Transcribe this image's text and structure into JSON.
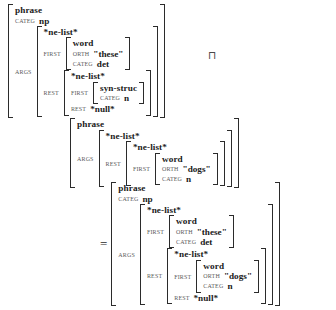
{
  "figure": {
    "kind": "avm-unification",
    "operator_symbol": "⊓",
    "equals_symbol": "=",
    "quote_open": "\"",
    "quote_close": "\""
  },
  "labels": {
    "categ": "CATEG",
    "args": "ARGS",
    "first": "FIRST",
    "rest": "REST",
    "orth": "ORTH"
  },
  "types": {
    "phrase": "phrase",
    "word": "word",
    "ne_list": "*ne-list*",
    "null_list": "*null*",
    "syn_struc": "syn-struc"
  },
  "values": {
    "np": "np",
    "det": "det",
    "n": "n",
    "these": "\"these\"",
    "dogs": "\"dogs\""
  },
  "left_avm": {
    "type": "phrase",
    "categ": "np",
    "args": {
      "type": "*ne-list*",
      "first": {
        "type": "word",
        "orth": "\"these\"",
        "categ": "det"
      },
      "rest": {
        "type": "*ne-list*",
        "first": {
          "type": "syn-struc",
          "categ": "n"
        },
        "rest": "*null*"
      }
    }
  },
  "right_avm": {
    "type": "phrase",
    "args": {
      "type": "*ne-list*",
      "rest": {
        "type": "*ne-list*",
        "first": {
          "type": "word",
          "orth": "\"dogs\"",
          "categ": "n"
        }
      }
    }
  },
  "result_avm": {
    "type": "phrase",
    "categ": "np",
    "args": {
      "type": "*ne-list*",
      "first": {
        "type": "word",
        "orth": "\"these\"",
        "categ": "det"
      },
      "rest": {
        "type": "*ne-list*",
        "first": {
          "type": "word",
          "orth": "\"dogs\"",
          "categ": "n"
        },
        "rest": "*null*"
      }
    }
  }
}
